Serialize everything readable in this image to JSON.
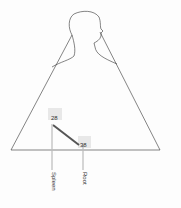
{
  "diagram": {
    "type": "body-outline-triangle",
    "points": [
      {
        "value": "28",
        "label": "Spleen"
      },
      {
        "value": "38",
        "label": "Root"
      }
    ],
    "colors": {
      "line": "#333333",
      "connector": "#555555",
      "highlight": "#e6e6e6",
      "marker": "#bbbbbb"
    }
  }
}
